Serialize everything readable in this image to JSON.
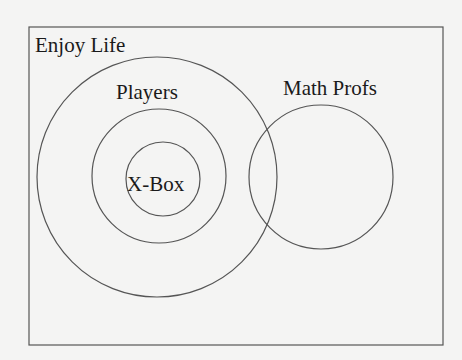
{
  "diagram": {
    "type": "venn",
    "universe": {
      "label": "Enjoy Life"
    },
    "sets": [
      {
        "id": "enjoy_outer",
        "label": "",
        "cx": 157,
        "cy": 177,
        "r": 120
      },
      {
        "id": "players",
        "label": "Players",
        "cx": 159,
        "cy": 176,
        "r": 67
      },
      {
        "id": "xbox",
        "label": "X-Box",
        "cx": 163,
        "cy": 179,
        "r": 37
      },
      {
        "id": "math_profs",
        "label": "Math Profs",
        "cx": 321,
        "cy": 177,
        "r": 72
      }
    ],
    "colors": {
      "stroke": "#555555",
      "background": "#f4f4f3",
      "text": "#1a1a1a"
    }
  }
}
